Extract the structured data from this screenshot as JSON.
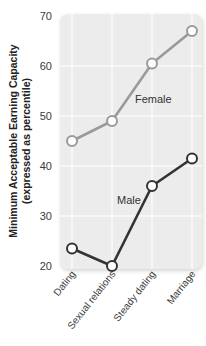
{
  "chart_data": {
    "type": "line",
    "title": "",
    "xlabel": "",
    "ylabel": "Minimum Acceptable Earning Capacity",
    "ylabel_line2": "(expressed as percentile)",
    "categories": [
      "Dating",
      "Sexual relations",
      "Steady dating",
      "Marriage"
    ],
    "series": [
      {
        "name": "Female",
        "values": [
          45,
          49,
          60.5,
          67
        ],
        "color": "#9a9a9a"
      },
      {
        "name": "Male",
        "values": [
          23.5,
          20,
          36,
          41.5
        ],
        "color": "#333333"
      }
    ],
    "yticks": [
      20,
      30,
      40,
      50,
      60,
      70
    ],
    "ylim": [
      20,
      70
    ],
    "grid": true,
    "legend": "inline labels"
  },
  "colors": {
    "panel": "#ececec",
    "grid": "#ffffff",
    "marker_fill": "#ffffff"
  }
}
